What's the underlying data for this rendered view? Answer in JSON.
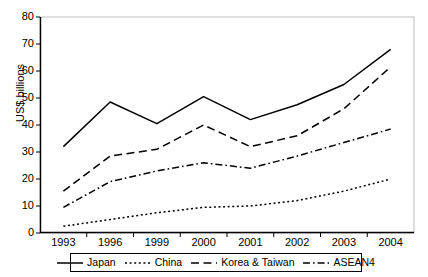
{
  "chart_data": {
    "type": "line",
    "title": "",
    "subtitle": "",
    "xlabel": "",
    "ylabel": "US$ billions",
    "categories": [
      "1993",
      "1996",
      "1999",
      "2000",
      "2001",
      "2002",
      "2003",
      "2004"
    ],
    "ylim": [
      0,
      80
    ],
    "ytick_step": 10,
    "yticks": [
      "0",
      "10",
      "20",
      "30",
      "40",
      "50",
      "60",
      "70",
      "80"
    ],
    "grid": false,
    "legend_position": "bottom",
    "series": [
      {
        "name": "Japan",
        "style": "solid",
        "color": "#000000",
        "values": [
          32,
          48.5,
          40.5,
          50.5,
          42,
          47.5,
          55,
          68
        ]
      },
      {
        "name": "China",
        "style": "dotted",
        "color": "#000000",
        "values": [
          2.5,
          5,
          7.5,
          9.5,
          10,
          12,
          15.5,
          20
        ]
      },
      {
        "name": "Korea & Taiwan",
        "style": "dashed",
        "color": "#000000",
        "values": [
          15.5,
          28.5,
          31,
          40,
          32,
          36,
          46,
          61.5
        ]
      },
      {
        "name": "ASEAN4",
        "style": "dashdot",
        "color": "#000000",
        "values": [
          9.5,
          19,
          23,
          26,
          24,
          28.5,
          33.5,
          38.5
        ]
      }
    ]
  },
  "legend": {
    "items": [
      {
        "label": "Japan"
      },
      {
        "label": "China"
      },
      {
        "label": "Korea & Taiwan"
      },
      {
        "label": "ASEAN4"
      }
    ]
  },
  "axes": {
    "plot_border_color": "#000000",
    "background": "#ffffff"
  }
}
